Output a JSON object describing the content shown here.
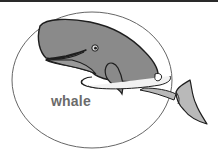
{
  "figure": {
    "label": "whale",
    "colors": {
      "border": "#2a2a2a",
      "ellipse": "#666666",
      "whale_body": "#8a8a8a",
      "whale_outline": "#1e1e1e",
      "fin_fill": "#b9b9b9",
      "water_highlight": "#f2f2f2",
      "label": "#6b6b6b"
    }
  }
}
